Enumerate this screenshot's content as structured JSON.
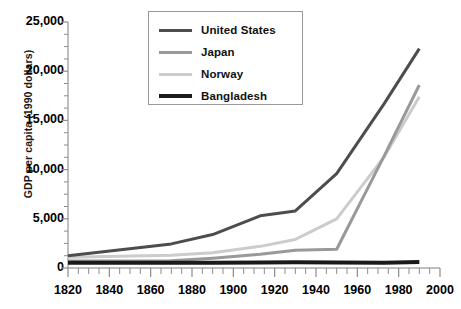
{
  "chart_data": {
    "type": "line",
    "title": "",
    "xlabel": "",
    "ylabel": "GDP per capita (1990 dollars)",
    "xlim": [
      1820,
      2000
    ],
    "ylim": [
      0,
      25000
    ],
    "xticks": [
      1820,
      1840,
      1860,
      1880,
      1900,
      1920,
      1940,
      1960,
      1980,
      2000
    ],
    "yticks": [
      0,
      5000,
      10000,
      15000,
      20000,
      25000
    ],
    "ytick_labels": [
      "0",
      "5,000",
      "10,000",
      "15,000",
      "20,000",
      "25,000"
    ],
    "xtick_labels": [
      "1820",
      "1840",
      "1860",
      "1880",
      "1900",
      "1920",
      "1940",
      "1960",
      "1980",
      "2000"
    ],
    "x_minor_tick_step": 5,
    "y_minor_tick_step": 1250,
    "grid": false,
    "legend_position": "top-center",
    "series": [
      {
        "name": "United States",
        "color": "#4d4d4d",
        "width": 3,
        "x": [
          1820,
          1870,
          1890,
          1913,
          1930,
          1950,
          1973,
          1990
        ],
        "values": [
          1250,
          2450,
          3400,
          5300,
          5800,
          9600,
          16700,
          22300
        ]
      },
      {
        "name": "Japan",
        "color": "#999999",
        "width": 3,
        "x": [
          1820,
          1870,
          1890,
          1913,
          1930,
          1950,
          1973,
          1990
        ],
        "values": [
          700,
          740,
          1000,
          1400,
          1800,
          1900,
          11400,
          18600
        ]
      },
      {
        "name": "Norway",
        "color": "#cccccc",
        "width": 3,
        "x": [
          1820,
          1870,
          1890,
          1913,
          1930,
          1950,
          1973,
          1990
        ],
        "values": [
          1100,
          1300,
          1550,
          2200,
          2900,
          5000,
          11300,
          17400
        ]
      },
      {
        "name": "Bangladesh",
        "color": "#1a1a1a",
        "width": 4,
        "x": [
          1820,
          1870,
          1890,
          1913,
          1930,
          1950,
          1973,
          1990
        ],
        "values": [
          530,
          530,
          540,
          560,
          580,
          560,
          540,
          600
        ]
      }
    ]
  },
  "legend": {
    "items": [
      {
        "label": "United States",
        "color": "#4d4d4d",
        "thickness": 3
      },
      {
        "label": "Japan",
        "color": "#999999",
        "thickness": 3
      },
      {
        "label": "Norway",
        "color": "#cccccc",
        "thickness": 3
      },
      {
        "label": "Bangladesh",
        "color": "#1a1a1a",
        "thickness": 4
      }
    ]
  },
  "axis": {
    "y_title": "GDP per capita (1990 dollars)"
  }
}
